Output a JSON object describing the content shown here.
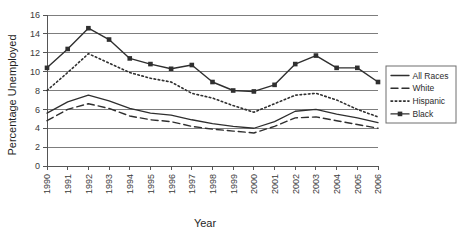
{
  "chart_data": {
    "type": "line",
    "title": "",
    "xlabel": "Year",
    "ylabel": "Percentage Unemployed",
    "categories": [
      "1990",
      "1991",
      "1992",
      "1993",
      "1994",
      "1995",
      "1996",
      "1997",
      "1998",
      "1999",
      "2000",
      "2001",
      "2002",
      "2003",
      "2004",
      "2005",
      "2006"
    ],
    "x": [
      1990,
      1991,
      1992,
      1993,
      1994,
      1995,
      1996,
      1997,
      1998,
      1999,
      2000,
      2001,
      2002,
      2003,
      2004,
      2005,
      2006
    ],
    "ylim": [
      0,
      16
    ],
    "y_ticks": [
      "0",
      "2",
      "4",
      "6",
      "8",
      "10",
      "12",
      "14",
      "16"
    ],
    "xlim": [
      1990,
      2006
    ],
    "grid": "horizontal",
    "legend_position": "right",
    "series": [
      {
        "name": "All Races",
        "style": "solid",
        "marker": "none",
        "color": "#2f2f2f",
        "values": [
          5.6,
          6.8,
          7.5,
          6.9,
          6.1,
          5.6,
          5.4,
          4.9,
          4.5,
          4.2,
          4.0,
          4.7,
          5.8,
          6.0,
          5.5,
          5.1,
          4.6
        ]
      },
      {
        "name": "White",
        "style": "dashed",
        "marker": "none",
        "color": "#2f2f2f",
        "values": [
          4.8,
          6.0,
          6.6,
          6.1,
          5.3,
          4.9,
          4.7,
          4.2,
          3.9,
          3.7,
          3.5,
          4.2,
          5.1,
          5.2,
          4.8,
          4.4,
          4.0
        ]
      },
      {
        "name": "Hispanic",
        "style": "dotted",
        "marker": "none",
        "color": "#2f2f2f",
        "values": [
          8.0,
          9.9,
          11.9,
          10.9,
          9.9,
          9.3,
          8.9,
          7.7,
          7.2,
          6.4,
          5.7,
          6.6,
          7.5,
          7.7,
          7.0,
          6.0,
          5.2
        ]
      },
      {
        "name": "Black",
        "style": "solid",
        "marker": "square",
        "color": "#2f2f2f",
        "values": [
          10.4,
          12.4,
          14.6,
          13.4,
          11.4,
          10.8,
          10.3,
          10.7,
          8.9,
          8.0,
          7.9,
          8.6,
          10.8,
          11.7,
          10.4,
          10.4,
          8.9
        ]
      }
    ]
  },
  "legend": {
    "entries": [
      {
        "label": "All Races"
      },
      {
        "label": "White"
      },
      {
        "label": "Hispanic"
      },
      {
        "label": "Black"
      }
    ]
  }
}
